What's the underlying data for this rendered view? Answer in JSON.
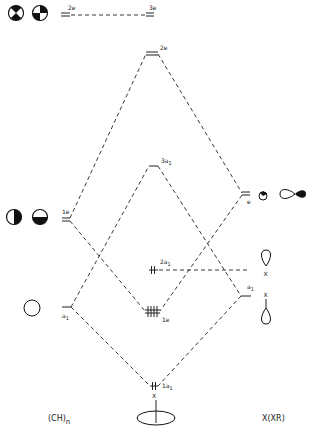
{
  "diagram": {
    "type": "molecular-orbital-correlation",
    "left_fragment": {
      "label": "(CH)",
      "label_subscript": "n",
      "levels": [
        {
          "name": "2e",
          "symmetry": "2e"
        },
        {
          "name": "1e",
          "symmetry": "1e"
        },
        {
          "name": "a1",
          "symmetry": "a",
          "subscript": "1"
        }
      ]
    },
    "right_fragment": {
      "label": "X(XR)",
      "levels": [
        {
          "name": "3e",
          "symmetry": "3e"
        },
        {
          "name": "e",
          "symmetry": "e"
        },
        {
          "name": "a1",
          "symmetry": "a",
          "subscript": "1"
        }
      ]
    },
    "molecule_levels": [
      {
        "name": "2e",
        "label": "2e"
      },
      {
        "name": "3a1",
        "label": "3a",
        "subscript": "1"
      },
      {
        "name": "2a1",
        "label": "2a",
        "subscript": "1",
        "electrons": "2"
      },
      {
        "name": "1e",
        "label": "1e",
        "electrons": "4"
      },
      {
        "name": "1a1",
        "label": "1a",
        "subscript": "1",
        "electrons": "2"
      }
    ],
    "atom_label": "X"
  }
}
